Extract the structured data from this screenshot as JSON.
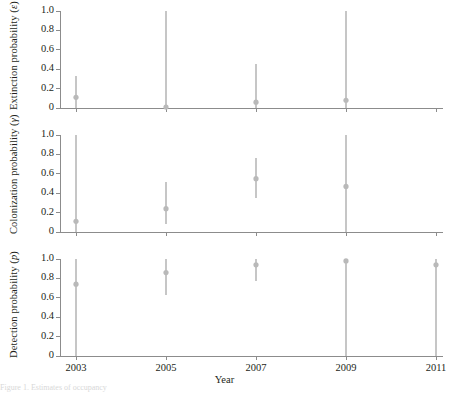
{
  "figure": {
    "background": "#ffffff",
    "axis_color": "#8c8c8c",
    "marker_color": "#b9b9b9",
    "errorbar_color": "#c6c6c6",
    "text_color": "#231f20",
    "xlabel": "Year",
    "caption_fragment": "Figure 1. Estimates of occupancy"
  },
  "chart_data": [
    {
      "type": "scatter",
      "title": "",
      "panel_id": "extinction",
      "ylabel": "Extinction probability (ε)",
      "ylabel_prefix": "Extinction probability (",
      "ylabel_symbol": "ε",
      "ylabel_suffix": ")",
      "xlabel": "",
      "ylim": [
        0,
        1.0
      ],
      "xlim": [
        2002,
        2011.6
      ],
      "yticks": [
        0,
        0.2,
        0.4,
        0.6,
        0.8,
        1.0
      ],
      "ytick_labels": [
        "0",
        "0.2",
        "0.4",
        "0.6",
        "0.8",
        "1.0"
      ],
      "xticks": [
        2003,
        2005,
        2007,
        2009,
        2011
      ],
      "xtick_labels": [
        "",
        "",
        "",
        "",
        ""
      ],
      "grid": false,
      "legend": "none",
      "x": [
        2003,
        2005,
        2007,
        2009
      ],
      "values": [
        0.11,
        0.01,
        0.06,
        0.08
      ],
      "err_low": [
        0.0,
        0.0,
        0.0,
        0.0
      ],
      "err_high": [
        0.33,
        1.0,
        0.45,
        1.0
      ]
    },
    {
      "type": "scatter",
      "title": "",
      "panel_id": "colonization",
      "ylabel": "Colonization probability (γ)",
      "ylabel_prefix": "Colonization probability (",
      "ylabel_symbol": "γ",
      "ylabel_suffix": ")",
      "xlabel": "",
      "ylim": [
        0,
        1.0
      ],
      "xlim": [
        2002,
        2011.6
      ],
      "yticks": [
        0,
        0.2,
        0.4,
        0.6,
        0.8,
        1.0
      ],
      "ytick_labels": [
        "0",
        "0.2",
        "0.4",
        "0.6",
        "0.8",
        "1.0"
      ],
      "xticks": [
        2003,
        2005,
        2007,
        2009,
        2011
      ],
      "xtick_labels": [
        "",
        "",
        "",
        "",
        ""
      ],
      "grid": false,
      "legend": "none",
      "x": [
        2003,
        2005,
        2007,
        2009
      ],
      "values": [
        0.11,
        0.24,
        0.55,
        0.47
      ],
      "err_low": [
        0.0,
        0.08,
        0.35,
        0.0
      ],
      "err_high": [
        1.0,
        0.52,
        0.76,
        1.0
      ]
    },
    {
      "type": "scatter",
      "title": "",
      "panel_id": "detection",
      "ylabel": "Detection probability (p)",
      "ylabel_prefix": "Detection probability (",
      "ylabel_symbol": "p",
      "ylabel_suffix": ")",
      "xlabel": "Year",
      "ylim": [
        0,
        1.0
      ],
      "xlim": [
        2002,
        2011.6
      ],
      "yticks": [
        0,
        0.2,
        0.4,
        0.6,
        0.8,
        1.0
      ],
      "ytick_labels": [
        "0",
        "0.2",
        "0.4",
        "0.6",
        "0.8",
        "1.0"
      ],
      "xticks": [
        2003,
        2005,
        2007,
        2009,
        2011
      ],
      "xtick_labels": [
        "2003",
        "2005",
        "2007",
        "2009",
        "2011"
      ],
      "grid": false,
      "legend": "none",
      "x": [
        2003,
        2005,
        2007,
        2009,
        2011
      ],
      "values": [
        0.74,
        0.86,
        0.94,
        0.98,
        0.94
      ],
      "err_low": [
        0.0,
        0.63,
        0.77,
        0.0,
        0.0
      ],
      "err_high": [
        1.0,
        1.0,
        1.0,
        1.0,
        1.0
      ]
    }
  ]
}
